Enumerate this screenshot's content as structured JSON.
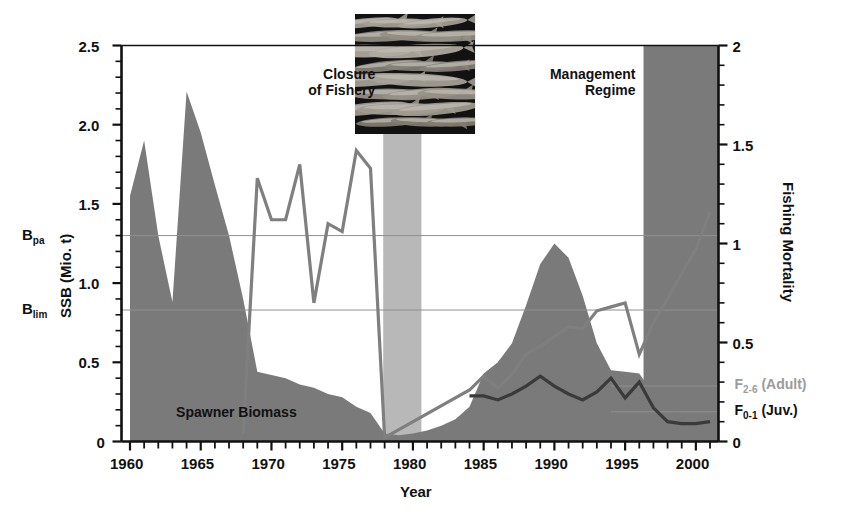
{
  "chart_data": {
    "type": "area",
    "title": "",
    "xlabel": "Year",
    "ylabel_left": "SSB (Mio. t)",
    "ylabel_right": "Fishing Mortality",
    "xlim": [
      1959.4,
      2001.6
    ],
    "ylim_left": [
      0,
      2.5
    ],
    "ylim_right": [
      0,
      2
    ],
    "xticks_major": [
      1960,
      1965,
      1970,
      1975,
      1980,
      1985,
      1990,
      1995,
      2000
    ],
    "xtick_labels": [
      "1960",
      "1965",
      "1970",
      "1975",
      "1980",
      "1985",
      "1990",
      "1995",
      "2000"
    ],
    "xtick_interval_minor": 1,
    "yticks_left": [
      0,
      0.5,
      1.0,
      1.5,
      2.0,
      2.5
    ],
    "ytick_left_labels": [
      "0",
      "0.5",
      "1.0",
      "1.5",
      "2.0",
      "2.5"
    ],
    "ytick_left_minor": 0.1,
    "yticks_right": [
      0,
      0.5,
      1,
      1.5,
      2
    ],
    "ytick_right_labels": [
      "0",
      "0.5",
      "1",
      "1.5",
      "2"
    ],
    "ytick_right_minor": 0.1,
    "grid": "horizontal-reference-lines-only",
    "legend_position": "right-axis-outside",
    "reference_lines": [
      {
        "name": "B_pa",
        "label": "B",
        "sub": "pa",
        "axis": "left",
        "value": 1.3
      },
      {
        "name": "B_lim",
        "label": "B",
        "sub": "lim",
        "axis": "left",
        "value": 0.83
      },
      {
        "name": "F_2-6",
        "label": "F",
        "sub": "2-6",
        "suffix": " (Adult)",
        "axis": "right",
        "value": 0.28,
        "color": "#9b9b9b"
      },
      {
        "name": "F_0-1",
        "label": "F",
        "sub": "0-1",
        "suffix": " (Juv.)",
        "axis": "right",
        "value": 0.15,
        "color": "#111111"
      }
    ],
    "bands": [
      {
        "name": "Closure of Fishery",
        "label": "Closure\nof Fishery",
        "x0": 1977.9,
        "x1": 1980.6,
        "color": "#b8b8b8",
        "label_side": "left"
      },
      {
        "name": "Management Regime",
        "label": "Management\nRegime",
        "x0": 1996.3,
        "x1": 2001.6,
        "color": "#7a7a7a",
        "label_side": "left"
      }
    ],
    "series": [
      {
        "name": "Spawner Biomass",
        "type": "area",
        "axis": "left",
        "color": "#7a7a7a",
        "label": "Spawner Biomass",
        "x": [
          1960,
          1961,
          1962,
          1963,
          1964,
          1965,
          1966,
          1967,
          1968,
          1969,
          1970,
          1971,
          1972,
          1973,
          1974,
          1975,
          1976,
          1977,
          1978,
          1979,
          1980,
          1981,
          1982,
          1983,
          1984,
          1985,
          1986,
          1987,
          1988,
          1989,
          1990,
          1991,
          1992,
          1993,
          1994,
          1995,
          1996,
          1997,
          1998,
          1999,
          2000,
          2001
        ],
        "values": [
          1.55,
          1.9,
          1.3,
          0.88,
          2.21,
          1.95,
          1.62,
          1.3,
          0.9,
          0.44,
          0.42,
          0.4,
          0.36,
          0.34,
          0.3,
          0.28,
          0.22,
          0.18,
          0.05,
          0.04,
          0.05,
          0.07,
          0.1,
          0.14,
          0.22,
          0.43,
          0.5,
          0.62,
          0.86,
          1.12,
          1.25,
          1.16,
          0.92,
          0.62,
          0.45,
          0.44,
          0.43,
          0.3,
          0.2,
          0.14,
          0.1,
          0.09
        ]
      },
      {
        "name": "F 2-6 Adult",
        "type": "line",
        "axis": "right",
        "color": "#7f7f7f",
        "label": "F2-6 (Adult)",
        "x": [
          1968,
          1969,
          1970,
          1971,
          1972,
          1973,
          1974,
          1975,
          1976,
          1977,
          1978,
          1984,
          1985,
          1986,
          1987,
          1988,
          1989,
          1990,
          1991,
          1992,
          1993,
          1994,
          1995,
          1996,
          1997,
          1998,
          1999,
          2000,
          2001
        ],
        "values": [
          0.04,
          1.33,
          1.12,
          1.12,
          1.4,
          0.7,
          1.1,
          1.06,
          1.47,
          1.38,
          0.02,
          0.26,
          0.33,
          0.27,
          0.34,
          0.44,
          0.48,
          0.53,
          0.58,
          0.57,
          0.66,
          0.68,
          0.7,
          0.44,
          0.6,
          0.72,
          0.85,
          0.97,
          1.16
        ]
      },
      {
        "name": "F 0-1 Juv",
        "type": "line",
        "axis": "right",
        "color": "#3a3a3a",
        "label": "F0-1 (Juv.)",
        "x": [
          1984,
          1985,
          1986,
          1987,
          1988,
          1989,
          1990,
          1991,
          1992,
          1993,
          1994,
          1995,
          1996,
          1997,
          1998,
          1999,
          2000,
          2001
        ],
        "values": [
          0.23,
          0.23,
          0.21,
          0.24,
          0.28,
          0.33,
          0.28,
          0.24,
          0.21,
          0.25,
          0.32,
          0.22,
          0.3,
          0.17,
          0.1,
          0.09,
          0.09,
          0.1
        ]
      }
    ],
    "annotations": [
      {
        "name": "spawner-biomass-label",
        "text": "Spawner Biomass",
        "x": 1967.5,
        "y": 0.18,
        "axis": "left"
      }
    ],
    "inset": {
      "name": "herring-school-photo",
      "caption": "",
      "x0": 1975.9,
      "x1": 1984.4,
      "y_top": 2.5,
      "y_bottom_frac": 0.25
    }
  },
  "colors": {
    "biomass_fill": "#7a7a7a",
    "band_closure": "#b8b8b8",
    "band_management": "#7a7a7a",
    "f_adult_line": "#7f7f7f",
    "f_juv_line": "#3a3a3a",
    "axis": "#111111",
    "reference_line": "#8f8f8f",
    "background": "#ffffff"
  }
}
